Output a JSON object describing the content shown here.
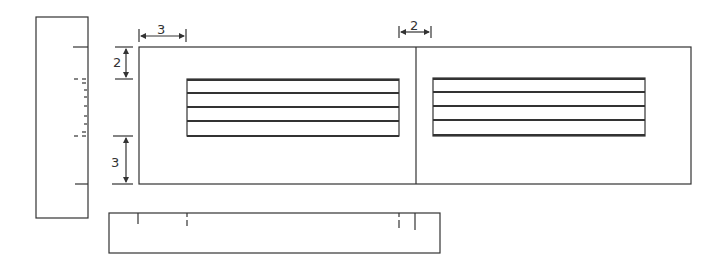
{
  "diagram": {
    "type": "orthographic-drawing",
    "views": [
      "side-view",
      "top-view",
      "front-view"
    ],
    "dimensions": {
      "left_margin": "3",
      "gap_between_panels": "2",
      "top_margin": "2",
      "bottom_margin": "3"
    },
    "panels": [
      {
        "name": "left-panel",
        "stripes": 5
      },
      {
        "name": "right-panel",
        "stripes": 5
      }
    ],
    "colors": {
      "line": "#333333",
      "background": "#ffffff"
    }
  }
}
